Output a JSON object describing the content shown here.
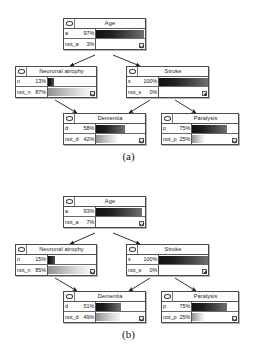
{
  "figure": {
    "type": "bayesian-network-diagrams",
    "panels": [
      {
        "label": "(a)",
        "nodes": [
          {
            "id": "age",
            "title": "Age",
            "icon": "ellipse-node-icon",
            "corner_icon": "checkbox-checked-icon",
            "states": [
              {
                "name": "a",
                "pct": "97%",
                "value": 97,
                "style": "dark"
              },
              {
                "name": "not_a",
                "pct": "3%",
                "value": 3,
                "style": "none"
              }
            ]
          },
          {
            "id": "neuronal-atrophy",
            "title": "Neuronal atrophy",
            "icon": "ellipse-node-icon",
            "corner_icon": "checkbox-checked-icon",
            "states": [
              {
                "name": "n",
                "pct": "13%",
                "value": 13,
                "style": "solidDark"
              },
              {
                "name": "not_n",
                "pct": "87%",
                "value": 87,
                "style": "light"
              }
            ]
          },
          {
            "id": "stroke",
            "title": "Stroke",
            "icon": "ellipse-node-icon",
            "corner_icon": "plus-box-icon",
            "states": [
              {
                "name": "s",
                "pct": "100%",
                "value": 100,
                "style": "dark"
              },
              {
                "name": "not_s",
                "pct": "0%",
                "value": 0,
                "style": "none"
              }
            ]
          },
          {
            "id": "dementia",
            "title": "Dementia",
            "icon": "ellipse-node-icon",
            "corner_icon": "checkbox-checked-icon",
            "states": [
              {
                "name": "d",
                "pct": "58%",
                "value": 58,
                "style": "dark"
              },
              {
                "name": "not_d",
                "pct": "42%",
                "value": 42,
                "style": "light"
              }
            ]
          },
          {
            "id": "paralysis",
            "title": "Paralysis",
            "icon": "ellipse-node-icon",
            "corner_icon": "checkbox-checked-icon",
            "states": [
              {
                "name": "p",
                "pct": "75%",
                "value": 75,
                "style": "dark"
              },
              {
                "name": "not_p",
                "pct": "25%",
                "value": 25,
                "style": "light"
              }
            ]
          }
        ],
        "edges": [
          {
            "from": "age",
            "to": "neuronal-atrophy"
          },
          {
            "from": "age",
            "to": "stroke"
          },
          {
            "from": "neuronal-atrophy",
            "to": "dementia"
          },
          {
            "from": "stroke",
            "to": "dementia"
          },
          {
            "from": "stroke",
            "to": "paralysis"
          }
        ]
      },
      {
        "label": "(b)",
        "nodes": [
          {
            "id": "age",
            "title": "Age",
            "icon": "ellipse-node-icon",
            "corner_icon": "checkbox-checked-icon",
            "states": [
              {
                "name": "a",
                "pct": "93%",
                "value": 93,
                "style": "dark"
              },
              {
                "name": "not_a",
                "pct": "7%",
                "value": 7,
                "style": "none"
              }
            ]
          },
          {
            "id": "neuronal-atrophy",
            "title": "Neuronal atrophy",
            "icon": "ellipse-node-icon",
            "corner_icon": "checkbox-checked-icon",
            "states": [
              {
                "name": "n",
                "pct": "15%",
                "value": 15,
                "style": "solidDark"
              },
              {
                "name": "not_n",
                "pct": "85%",
                "value": 85,
                "style": "light"
              }
            ]
          },
          {
            "id": "stroke",
            "title": "Stroke",
            "icon": "ellipse-node-icon",
            "corner_icon": "plus-box-icon",
            "states": [
              {
                "name": "s",
                "pct": "100%",
                "value": 100,
                "style": "dark"
              },
              {
                "name": "not_s",
                "pct": "0%",
                "value": 0,
                "style": "none"
              }
            ]
          },
          {
            "id": "dementia",
            "title": "Dementia",
            "icon": "ellipse-node-icon",
            "corner_icon": "checkbox-checked-icon",
            "states": [
              {
                "name": "d",
                "pct": "51%",
                "value": 51,
                "style": "dark"
              },
              {
                "name": "not_d",
                "pct": "49%",
                "value": 49,
                "style": "light"
              }
            ]
          },
          {
            "id": "paralysis",
            "title": "Paralysis",
            "icon": "ellipse-node-icon",
            "corner_icon": "checkbox-checked-icon",
            "states": [
              {
                "name": "p",
                "pct": "75%",
                "value": 75,
                "style": "dark"
              },
              {
                "name": "not_p",
                "pct": "25%",
                "value": 25,
                "style": "light"
              }
            ]
          }
        ],
        "edges": [
          {
            "from": "age",
            "to": "neuronal-atrophy"
          },
          {
            "from": "age",
            "to": "stroke"
          },
          {
            "from": "neuronal-atrophy",
            "to": "dementia"
          },
          {
            "from": "stroke",
            "to": "dementia"
          },
          {
            "from": "stroke",
            "to": "paralysis"
          }
        ]
      }
    ]
  }
}
